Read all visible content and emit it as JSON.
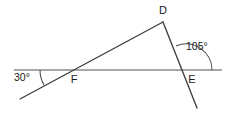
{
  "figure": {
    "type": "geometry-diagram",
    "width": 230,
    "height": 115,
    "background_color": "#ffffff"
  },
  "labels": {
    "vertex_d": "D",
    "vertex_f": "F",
    "vertex_e": "E",
    "angle_at_f": "30°",
    "angle_at_e": "105°"
  },
  "colors": {
    "ray_stroke": "#3d3d3d",
    "base_line_stroke": "#8a8a8a",
    "arc_stroke": "#4a4a4a",
    "text": "#1a1a1a"
  },
  "geometry": {
    "horizontal_line": {
      "x1": 14,
      "y1": 70,
      "x2": 222,
      "y2": 70
    },
    "transversal_fd": {
      "x1": 20,
      "y1": 99,
      "x2": 163,
      "y2": 22
    },
    "line_de": {
      "x1": 163,
      "y1": 22,
      "x2": 197,
      "y2": 108
    },
    "points": {
      "D": {
        "x": 163,
        "y": 22
      },
      "F": {
        "x": 70,
        "y": 70
      },
      "E": {
        "x": 186,
        "y": 70
      }
    },
    "arcs": {
      "at_f": {
        "cx": 70,
        "cy": 70,
        "radius": 30,
        "measure": 30
      },
      "at_e": {
        "cx": 186,
        "cy": 70,
        "radius": 26,
        "measure": 105
      }
    }
  },
  "label_positions": {
    "vertex_d": {
      "x": 163,
      "y": 14
    },
    "vertex_f": {
      "x": 74,
      "y": 83
    },
    "vertex_e": {
      "x": 192,
      "y": 83
    },
    "angle_at_f": {
      "x": 14,
      "y": 81
    },
    "angle_at_e": {
      "x": 186,
      "y": 50
    }
  }
}
